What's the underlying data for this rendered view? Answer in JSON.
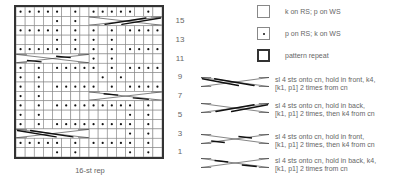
{
  "chart": {
    "caption": "16-st rep",
    "columns": 16,
    "rows_count": 16,
    "row_numbers": [
      "15",
      "13",
      "11",
      "9",
      "7",
      "5",
      "3",
      "1"
    ],
    "grid_rows_top_to_bottom": [
      {
        "row": 16,
        "cells": ".....-.-.....-.-"
      },
      {
        "row": 15,
        "cells": "----.-.-CCCCCCCC",
        "cable": {
          "start": 9,
          "type": "back-full"
        }
      },
      {
        "row": 14,
        "cells": ".....-.-.-.-...."
      },
      {
        "row": 13,
        "cells": "----.-.-.-.-----"
      },
      {
        "row": 12,
        "cells": ".....-.-.-.-...."
      },
      {
        "row": 11,
        "cells": "CCCCCCCC.-.-----",
        "cable": {
          "start": 1,
          "type": "front-split"
        }
      },
      {
        "row": 10,
        "cells": ".-.-.....-.-...."
      },
      {
        "row": 9,
        "cells": ".-.------.-.----"
      },
      {
        "row": 8,
        "cells": ".-.-.....-.-...."
      },
      {
        "row": 7,
        "cells": ".-.-----CCCCCCCC",
        "cable": {
          "start": 9,
          "type": "back-split"
        }
      },
      {
        "row": 6,
        "cells": ".-.-.........-.-"
      },
      {
        "row": 5,
        "cells": ".-.---------.-.-"
      },
      {
        "row": 4,
        "cells": ".-.-.........-.-"
      },
      {
        "row": 3,
        "cells": "CCCCCCCC----.-.-",
        "cable": {
          "start": 1,
          "type": "front-full"
        }
      },
      {
        "row": 2,
        "cells": ".....-.-.....-.-"
      },
      {
        "row": 1,
        "cells": "----.-.-----.-.-"
      }
    ]
  },
  "legend": {
    "items": [
      {
        "symbol": "empty-box",
        "text": "k on RS; p on WS"
      },
      {
        "symbol": "dot-box",
        "text": "p on RS; k on WS"
      },
      {
        "symbol": "thick-box",
        "text": "pattern repeat"
      }
    ],
    "cables": [
      {
        "type": "front-full",
        "line1": "sl 4 sts onto cn, hold in front, k4,",
        "line2": "[k1, p1] 2 times from cn"
      },
      {
        "type": "back-full",
        "line1": "sl 4 sts onto cn, hold in back,",
        "line2": "[k1, p1] 2 times, then k4 from cn"
      },
      {
        "type": "front-split",
        "line1": "sl 4 sts onto cn, hold in front,",
        "line2": "[k1, p1] 2 times, then k4 from cn"
      },
      {
        "type": "back-split",
        "line1": "sl 4 sts onto cn, hold in back, k4,",
        "line2": "[k1, p1] 2 times from cn"
      }
    ]
  }
}
